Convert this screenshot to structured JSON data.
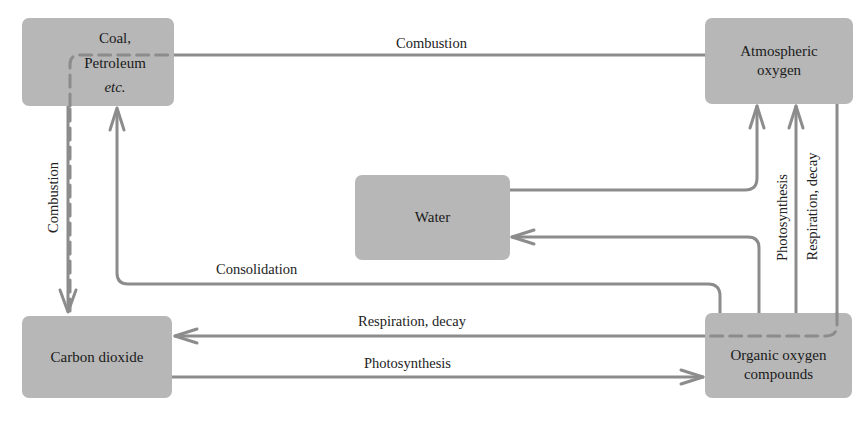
{
  "diagram": {
    "nodes": {
      "coal": {
        "line1": "Coal,",
        "line2": "Petroleum",
        "line3": "etc."
      },
      "atmospheric_oxygen": {
        "line1": "Atmospheric",
        "line2": "oxygen"
      },
      "water": {
        "label": "Water"
      },
      "carbon_dioxide": {
        "label": "Carbon dioxide"
      },
      "organic_oxygen_compounds": {
        "line1": "Organic oxygen",
        "line2": "compounds"
      }
    },
    "edges": {
      "coal_to_atmo_combustion": "Combustion",
      "coal_to_co2_combustion": "Combustion",
      "organic_to_coal_consolidation": "Consolidation",
      "organic_to_co2_respiration": "Respiration, decay",
      "co2_to_organic_photosynthesis": "Photosynthesis",
      "organic_to_atmo_photosynthesis": "Photosynthesis",
      "organic_to_atmo_respiration": "Respiration, decay"
    },
    "colors": {
      "box": "#b7b7b7",
      "line": "#8c8c8c",
      "text": "#1a1a1a"
    }
  }
}
